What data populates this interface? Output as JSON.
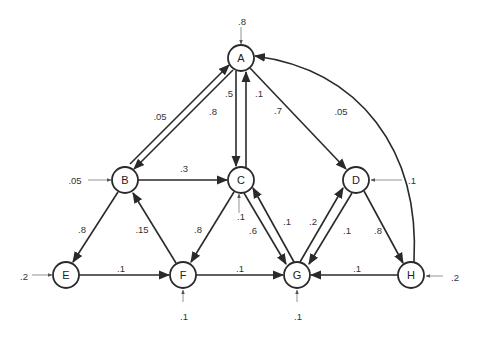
{
  "diagram": {
    "type": "weighted-directed-graph",
    "nodes": [
      {
        "id": "A",
        "label": "A",
        "x": 241,
        "y": 58
      },
      {
        "id": "B",
        "label": "B",
        "x": 125,
        "y": 180
      },
      {
        "id": "C",
        "label": "C",
        "x": 241,
        "y": 180
      },
      {
        "id": "D",
        "label": "D",
        "x": 356,
        "y": 180
      },
      {
        "id": "E",
        "label": "E",
        "x": 66,
        "y": 275
      },
      {
        "id": "F",
        "label": "F",
        "x": 183,
        "y": 275
      },
      {
        "id": "G",
        "label": "G",
        "x": 297,
        "y": 275
      },
      {
        "id": "H",
        "label": "H",
        "x": 411,
        "y": 275
      }
    ],
    "edges": [
      {
        "from": "B",
        "to": "A",
        "weight": ".05"
      },
      {
        "from": "A",
        "to": "B",
        "weight": ".8"
      },
      {
        "from": "A",
        "to": "C",
        "weight": ".5"
      },
      {
        "from": "C",
        "to": "A",
        "weight": ".1"
      },
      {
        "from": "A",
        "to": "D",
        "weight": ".7"
      },
      {
        "from": "H",
        "to": "A",
        "weight": ".05"
      },
      {
        "from": "B",
        "to": "C",
        "weight": ".3"
      },
      {
        "from": "B",
        "to": "E",
        "weight": ".8"
      },
      {
        "from": "F",
        "to": "B",
        "weight": ".15"
      },
      {
        "from": "C",
        "to": "F",
        "weight": ".8"
      },
      {
        "from": "C",
        "to": "G",
        "weight": ".6"
      },
      {
        "from": "G",
        "to": "C",
        "weight": ".1"
      },
      {
        "from": "G",
        "to": "D",
        "weight": ".2"
      },
      {
        "from": "D",
        "to": "G",
        "weight": ".1"
      },
      {
        "from": "D",
        "to": "H",
        "weight": ".8"
      },
      {
        "from": "E",
        "to": "F",
        "weight": ".1"
      },
      {
        "from": "F",
        "to": "G",
        "weight": ".1"
      },
      {
        "from": "H",
        "to": "G",
        "weight": ".1"
      }
    ],
    "external_inputs": [
      {
        "to": "A",
        "weight": ".8"
      },
      {
        "to": "B",
        "weight": ".05"
      },
      {
        "to": "C",
        "weight": ".1"
      },
      {
        "to": "D",
        "weight": ".1"
      },
      {
        "to": "E",
        "weight": ".2"
      },
      {
        "to": "F",
        "weight": ".1"
      },
      {
        "to": "G",
        "weight": ".1"
      },
      {
        "to": "H",
        "weight": ".2"
      }
    ]
  }
}
